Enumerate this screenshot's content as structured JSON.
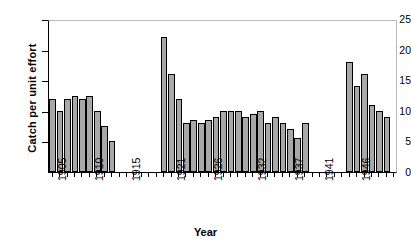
{
  "chart_data": {
    "type": "bar",
    "title": "",
    "xlabel": "Year",
    "ylabel": "Catch per unit effort",
    "ylim": [
      0,
      25
    ],
    "yticks": [
      0,
      5,
      10,
      15,
      20,
      25
    ],
    "xlim": [
      1904.5,
      1951.5
    ],
    "xtick_labels": [
      "1905",
      "1910",
      "1915",
      "1921",
      "1926",
      "1932",
      "1937",
      "1941",
      "1946"
    ],
    "xtick_years": [
      1905,
      1910,
      1915,
      1921,
      1926,
      1932,
      1937,
      1941,
      1946
    ],
    "grid": false,
    "legend": "none",
    "bar_fill_color": "#a8a8a8",
    "bar_edge_color": "#000000",
    "categories": [
      1905,
      1906,
      1907,
      1908,
      1909,
      1910,
      1911,
      1912,
      1913,
      1920,
      1921,
      1922,
      1923,
      1924,
      1925,
      1926,
      1927,
      1928,
      1929,
      1930,
      1931,
      1932,
      1933,
      1934,
      1935,
      1936,
      1937,
      1938,
      1939,
      1945,
      1946,
      1947,
      1948,
      1949,
      1950
    ],
    "values": [
      12,
      10,
      12,
      12.5,
      12,
      12.5,
      10,
      7.5,
      5,
      22,
      16,
      12,
      8,
      8.5,
      8,
      8.5,
      9,
      10,
      10,
      10,
      9,
      9.5,
      10,
      8,
      9,
      8,
      7,
      5.5,
      8,
      18,
      14,
      16,
      11,
      10,
      9
    ],
    "missing_years": [
      1914,
      1915,
      1916,
      1917,
      1918,
      1919,
      1940,
      1941,
      1942,
      1943,
      1944,
      1951
    ]
  }
}
